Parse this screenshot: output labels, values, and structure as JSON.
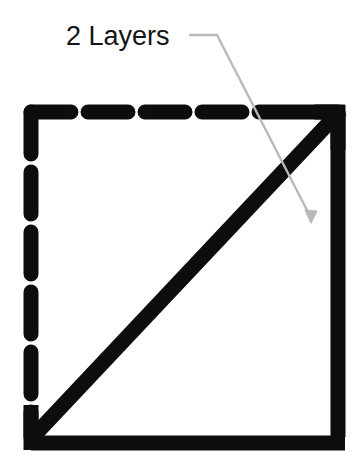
{
  "figure": {
    "title": "",
    "background_color": "#ffffff",
    "annotation": {
      "label": "2 Layers",
      "text_color": "#141414",
      "leader_line_color": "#b9b9b9",
      "leader_line_width": 2,
      "leader_path": "M 190 35 L 218 35 L 312 219",
      "arrow_tip": {
        "x": 312,
        "y": 222
      }
    },
    "shape": {
      "name": "square-with-diagonal",
      "stroke_color": "#0d0d0d",
      "bounds": {
        "x": 24,
        "y": 105,
        "width": 321,
        "height": 339
      },
      "edges": [
        {
          "name": "top-edge",
          "style": "dashed",
          "thickness": 15,
          "dash_count": 6
        },
        {
          "name": "left-edge",
          "style": "dashed",
          "thickness": 15,
          "dash_count": 6
        },
        {
          "name": "right-edge",
          "style": "solid",
          "thickness": 15
        },
        {
          "name": "bottom-edge",
          "style": "solid",
          "thickness": 15
        }
      ],
      "diagonal": {
        "name": "diagonal-line",
        "style": "solid",
        "thickness": 15,
        "from": {
          "x": 30,
          "y": 440
        },
        "to": {
          "x": 340,
          "y": 110
        }
      }
    }
  }
}
